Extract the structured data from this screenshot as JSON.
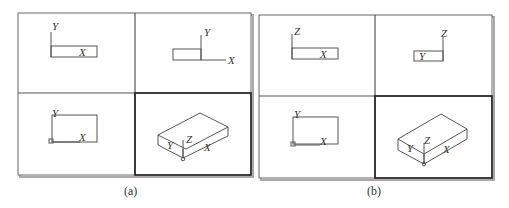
{
  "figures": [
    {
      "id": "a",
      "caption": "(a)",
      "viewports": [
        {
          "position": "top-left",
          "view": "top",
          "axes": [
            "Y",
            "X"
          ]
        },
        {
          "position": "top-right",
          "view": "right",
          "axes": [
            "Y",
            "X"
          ]
        },
        {
          "position": "bottom-left",
          "view": "plan-ucs",
          "axes": [
            "Y",
            "X"
          ]
        },
        {
          "position": "bottom-right",
          "view": "isometric",
          "axes": [
            "Y",
            "Z",
            "X"
          ],
          "active": true
        }
      ]
    },
    {
      "id": "b",
      "caption": "(b)",
      "viewports": [
        {
          "position": "top-left",
          "view": "front",
          "axes": [
            "Z",
            "X"
          ]
        },
        {
          "position": "top-right",
          "view": "side",
          "axes": [
            "Z",
            "Y"
          ]
        },
        {
          "position": "bottom-left",
          "view": "plan-ucs",
          "axes": [
            "Y",
            "X"
          ]
        },
        {
          "position": "bottom-right",
          "view": "isometric",
          "axes": [
            "Y",
            "Z",
            "X"
          ],
          "active": true
        }
      ]
    }
  ],
  "colors": {
    "line": "#555555",
    "frame": "#444444",
    "active_frame": "#222222",
    "shadow": "#999999"
  }
}
